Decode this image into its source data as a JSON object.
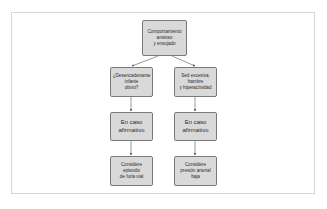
{
  "diagram": {
    "type": "flowchart",
    "colors": {
      "node_fill": "#d9d9d9",
      "node_border": "#7a7a7a",
      "edge": "#555555",
      "frame_border": "#d6d6d6",
      "text": "#2b2b2b"
    },
    "nodes": {
      "root": {
        "label": "Comportamiento\nansioso\ny ensujado"
      },
      "left_question": {
        "label": "¿Desencadenante\ninfante\nobvio?"
      },
      "right_question": {
        "label": "Sed excesiva,\nhambre\ny hiperactividad"
      },
      "left_condition": {
        "label": "En caso\nafirmativo"
      },
      "right_condition": {
        "label": "En caso\nafirmativo"
      },
      "left_result": {
        "label": "Considere\nepisodio\nde furia vial"
      },
      "right_result": {
        "label": "Considere\npresión arterial\nbaja"
      }
    },
    "edges": [
      {
        "from": "root",
        "to": "left_question"
      },
      {
        "from": "root",
        "to": "right_question"
      },
      {
        "from": "left_question",
        "to": "left_condition"
      },
      {
        "from": "right_question",
        "to": "right_condition"
      },
      {
        "from": "left_condition",
        "to": "left_result"
      },
      {
        "from": "right_condition",
        "to": "right_result"
      }
    ]
  }
}
